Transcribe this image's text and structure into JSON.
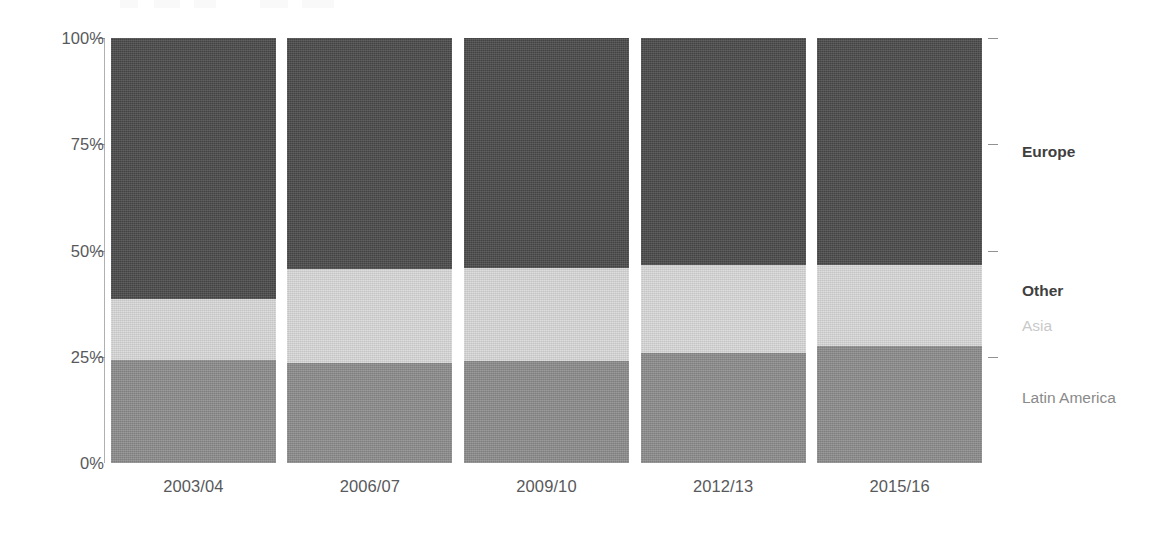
{
  "chart_data": {
    "type": "bar",
    "subtype": "stacked-100-percent",
    "title": "",
    "xlabel": "",
    "ylabel": "",
    "ylim": [
      0,
      100
    ],
    "y_tick_labels": [
      "100%",
      "75%",
      "50%",
      "25%",
      "0%"
    ],
    "y_tick_values": [
      100,
      75,
      50,
      25,
      0
    ],
    "grid": false,
    "legend_position": "right-direct-labels",
    "categories": [
      "2003/04",
      "2006/07",
      "2009/10",
      "2012/13",
      "2015/16"
    ],
    "series": [
      {
        "name": "Latin America",
        "color": "#8c8c8c",
        "values": [
          24.2,
          23.5,
          24.0,
          25.9,
          27.5
        ]
      },
      {
        "name": "Asia",
        "color": "#d9d9d9",
        "values": [
          14.4,
          22.1,
          21.9,
          20.7,
          19.1
        ]
      },
      {
        "name": "Other",
        "color": "#bfbfbf",
        "values": [
          0,
          0,
          0,
          0,
          0
        ]
      },
      {
        "name": "Europe",
        "color": "#4a4a4a",
        "values": [
          61.4,
          54.4,
          54.1,
          53.4,
          53.4
        ]
      }
    ],
    "legend_entries": [
      {
        "label": "Europe",
        "color": "#3f3f3f",
        "emphasis": "bold"
      },
      {
        "label": "Other",
        "color": "#3f3f3f",
        "emphasis": "bold"
      },
      {
        "label": "Asia",
        "color": "#c9c9c9",
        "emphasis": "normal"
      },
      {
        "label": "Latin America",
        "color": "#8a8a8a",
        "emphasis": "normal"
      }
    ]
  },
  "axis": {
    "y_ticks": [
      {
        "label": "100%",
        "value": 100
      },
      {
        "label": "75%",
        "value": 75
      },
      {
        "label": "50%",
        "value": 50
      },
      {
        "label": "25%",
        "value": 25
      },
      {
        "label": "0%",
        "value": 0
      }
    ],
    "x_ticks": [
      {
        "label": "2003/04"
      },
      {
        "label": "2006/07"
      },
      {
        "label": "2009/10"
      },
      {
        "label": "2012/13"
      },
      {
        "label": "2015/16"
      }
    ]
  },
  "colors": {
    "europe": "#4a4a4a",
    "asia": "#d9d9d9",
    "latin_america": "#8c8c8c",
    "axis": "#b0b0b0",
    "tick": "#8f9193",
    "text": "#58595b",
    "background": "#ffffff"
  }
}
